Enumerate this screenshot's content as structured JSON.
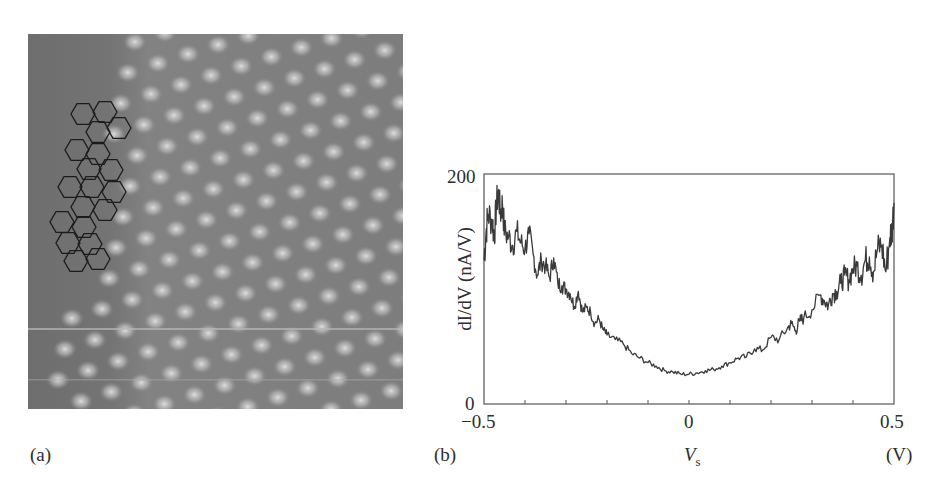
{
  "figure": {
    "panel_a": {
      "label": "(a)",
      "description": "STM topograph with honeycomb lattice overlay",
      "overlay": {
        "shape": "hexagon",
        "count": 19,
        "stroke_color": "#1a1a1a"
      },
      "colors": {
        "background": "#7c7c7c",
        "bright_spot": "#d9d9d9",
        "dark_region": "#6f6f6f"
      }
    },
    "panel_b": {
      "label": "(b)",
      "y_label_main": "dI/dV",
      "y_label_unit": "(nA/V)",
      "x_label_main": "V",
      "x_label_sub": "s",
      "x_unit": "(V)",
      "y_ticks": [
        "0",
        "200"
      ],
      "x_ticks": [
        "−0.5",
        "0",
        "0.5"
      ]
    }
  },
  "chart_data": {
    "type": "line",
    "title": "",
    "xlabel": "V_s (V)",
    "ylabel": "dI/dV (nA/V)",
    "xlim": [
      -0.5,
      0.5
    ],
    "ylim": [
      0,
      200
    ],
    "grid": false,
    "legend": "none",
    "x_tick_labels": [
      "-0.5",
      "0",
      "0.5"
    ],
    "y_tick_labels": [
      "0",
      "200"
    ],
    "minor_x_tick_step": 0.1,
    "series": [
      {
        "name": "dI/dV spectrum",
        "color": "#3a3a3a",
        "x": [
          -0.5,
          -0.495,
          -0.49,
          -0.48,
          -0.475,
          -0.47,
          -0.465,
          -0.46,
          -0.455,
          -0.45,
          -0.44,
          -0.43,
          -0.42,
          -0.41,
          -0.4,
          -0.39,
          -0.38,
          -0.37,
          -0.36,
          -0.35,
          -0.34,
          -0.33,
          -0.32,
          -0.31,
          -0.3,
          -0.29,
          -0.28,
          -0.27,
          -0.26,
          -0.25,
          -0.24,
          -0.23,
          -0.22,
          -0.21,
          -0.2,
          -0.18,
          -0.16,
          -0.14,
          -0.12,
          -0.1,
          -0.08,
          -0.06,
          -0.04,
          -0.02,
          0.0,
          0.02,
          0.04,
          0.06,
          0.08,
          0.1,
          0.12,
          0.14,
          0.16,
          0.18,
          0.2,
          0.22,
          0.24,
          0.25,
          0.26,
          0.27,
          0.28,
          0.3,
          0.32,
          0.33,
          0.34,
          0.35,
          0.36,
          0.37,
          0.38,
          0.39,
          0.4,
          0.41,
          0.42,
          0.43,
          0.44,
          0.45,
          0.46,
          0.47,
          0.48,
          0.49,
          0.495,
          0.5
        ],
        "y": [
          125,
          150,
          165,
          160,
          145,
          172,
          185,
          165,
          175,
          150,
          145,
          138,
          150,
          140,
          135,
          148,
          130,
          112,
          125,
          120,
          110,
          127,
          105,
          103,
          100,
          96,
          85,
          98,
          80,
          84,
          80,
          70,
          74,
          65,
          60,
          56,
          52,
          44,
          40,
          36,
          33,
          29,
          28,
          26,
          26,
          27,
          29,
          30,
          33,
          36,
          40,
          41,
          48,
          47,
          58,
          56,
          66,
          70,
          64,
          72,
          75,
          82,
          95,
          90,
          86,
          96,
          98,
          105,
          112,
          108,
          118,
          120,
          112,
          125,
          128,
          115,
          135,
          138,
          115,
          145,
          150,
          175
        ]
      }
    ],
    "annotations": [
      "minimum near V_s = 0 at ~26 nA/V"
    ]
  }
}
